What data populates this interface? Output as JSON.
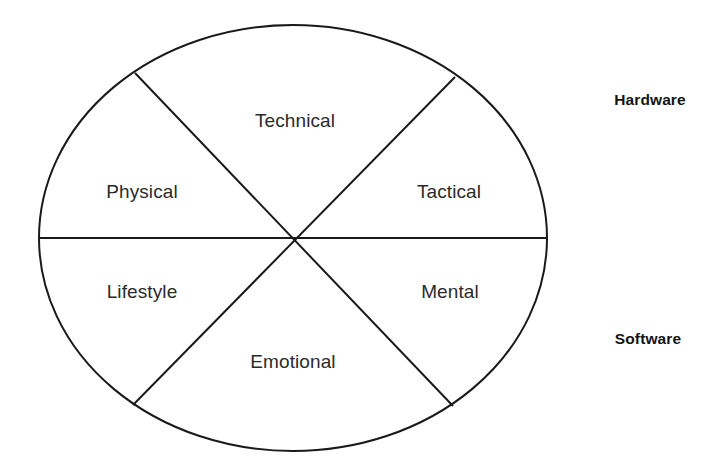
{
  "diagram": {
    "type": "wheel-six-sector",
    "shape": "ellipse",
    "stroke_color": "#1a1a1a",
    "text_color": "#2b2b2b",
    "side_label_color": "#141414",
    "background": "#ffffff",
    "sectors": [
      {
        "id": "technical",
        "label": "Technical",
        "x": 295,
        "y": 120,
        "group": "hardware"
      },
      {
        "id": "tactical",
        "label": "Tactical",
        "x": 449,
        "y": 191,
        "group": "hardware"
      },
      {
        "id": "mental",
        "label": "Mental",
        "x": 450,
        "y": 291,
        "group": "software"
      },
      {
        "id": "emotional",
        "label": "Emotional",
        "x": 293,
        "y": 361,
        "group": "software"
      },
      {
        "id": "lifestyle",
        "label": "Lifestyle",
        "x": 142,
        "y": 291,
        "group": "software"
      },
      {
        "id": "physical",
        "label": "Physical",
        "x": 142,
        "y": 191,
        "group": "hardware"
      }
    ],
    "side_labels": [
      {
        "id": "hardware",
        "label": "Hardware",
        "x": 650,
        "y": 100
      },
      {
        "id": "software",
        "label": "Software",
        "x": 648,
        "y": 339
      }
    ],
    "geometry": {
      "center_x": 293,
      "center_y": 238,
      "radius_x": 254,
      "radius_y": 213,
      "stroke_width": 2,
      "dividers": [
        {
          "id": "horizontal",
          "x1": 40,
          "y1": 238,
          "x2": 547,
          "y2": 238
        },
        {
          "id": "diagonal-nw-se",
          "x1": 135,
          "y1": 73,
          "x2": 453,
          "y2": 406
        },
        {
          "id": "diagonal-ne-sw",
          "x1": 455,
          "y1": 77,
          "x2": 133,
          "y2": 405
        }
      ]
    }
  }
}
